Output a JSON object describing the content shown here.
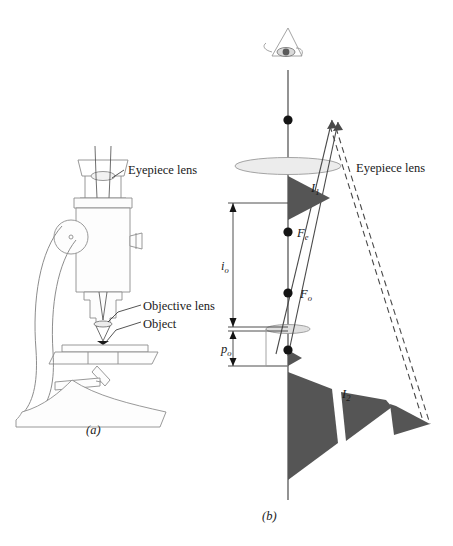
{
  "figure": {
    "background_color": "#ffffff",
    "ink_color": "#1a1a1a",
    "line_art_color": "#8a8a8a",
    "arrow_fill_color": "#555555",
    "lens_fill_color": "#e8e8e8"
  },
  "panel_a": {
    "caption": "(a)",
    "description": "Line drawing of a compound microscope instrument",
    "labels": {
      "eyepiece_lens": "Eyepiece lens",
      "objective_lens": "Objective lens",
      "object": "Object"
    }
  },
  "panel_b": {
    "caption": "(b)",
    "description": "Ray diagram of the compound microscope",
    "labels": {
      "eyepiece_lens": "Eyepiece lens",
      "first_image": "I",
      "first_image_sub": "1",
      "second_image": "I",
      "second_image_sub": "2",
      "focal_eyepiece": "F",
      "focal_eyepiece_sub": "e",
      "focal_objective": "F",
      "focal_objective_sub": "o",
      "image_distance": "i",
      "image_distance_sub": "o",
      "object_distance": "p",
      "object_distance_sub": "o"
    },
    "elements": {
      "eye_icon": "eye-icon",
      "optical_axis": "vertical optical axis line",
      "eyepiece_lens_shape": "wide converging lens ellipse",
      "objective_lens_shape": "small converging lens ellipse",
      "solid_rays": "2 solid ray lines with arrowheads",
      "dashed_rays": "2 dashed virtual ray lines",
      "axis_points": 4
    }
  }
}
